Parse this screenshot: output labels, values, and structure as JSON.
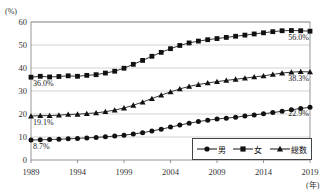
{
  "chart_data": {
    "type": "line",
    "title": "",
    "xlabel": "(年)",
    "ylabel": "(%)",
    "ylim": [
      0,
      60
    ],
    "yticks": [
      0,
      10,
      20,
      30,
      40,
      50,
      60
    ],
    "xticks": [
      "1989",
      "1994",
      "1999",
      "2004",
      "2009",
      "2014",
      "2019"
    ],
    "grid": true,
    "legend_position": "bottom-right",
    "x": [
      1989,
      1990,
      1991,
      1992,
      1993,
      1994,
      1995,
      1996,
      1997,
      1998,
      1999,
      2000,
      2001,
      2002,
      2003,
      2004,
      2005,
      2006,
      2007,
      2008,
      2009,
      2010,
      2011,
      2012,
      2013,
      2014,
      2015,
      2016,
      2017,
      2018,
      2019
    ],
    "series": [
      {
        "name": "男",
        "marker": "circle",
        "values": [
          8.7,
          8.8,
          8.9,
          9.0,
          9.2,
          9.4,
          9.6,
          9.8,
          10.1,
          10.4,
          10.8,
          11.3,
          11.9,
          12.6,
          13.4,
          14.3,
          15.2,
          16.0,
          16.7,
          17.3,
          17.8,
          18.2,
          18.6,
          19.1,
          19.6,
          20.1,
          20.6,
          21.2,
          21.8,
          22.4,
          22.9
        ],
        "label_start": "8.7%",
        "label_end": "22.9%"
      },
      {
        "name": "女",
        "marker": "square",
        "values": [
          36.0,
          36.4,
          36.1,
          36.3,
          36.6,
          36.4,
          36.8,
          37.1,
          37.8,
          38.6,
          39.9,
          41.6,
          43.3,
          45.1,
          46.8,
          48.4,
          49.8,
          50.9,
          51.7,
          52.3,
          52.8,
          53.3,
          53.8,
          54.3,
          54.8,
          55.3,
          55.8,
          56.2,
          56.3,
          56.2,
          56.0
        ],
        "label_start": "36.0%",
        "label_end": "56.0%"
      },
      {
        "name": "総数",
        "marker": "triangle",
        "values": [
          19.1,
          19.3,
          19.3,
          19.5,
          19.8,
          19.9,
          20.2,
          20.5,
          21.0,
          21.7,
          22.6,
          23.8,
          25.2,
          26.7,
          28.2,
          29.6,
          30.9,
          32.0,
          32.8,
          33.5,
          34.1,
          34.6,
          35.1,
          35.6,
          36.1,
          36.6,
          37.2,
          37.8,
          38.2,
          38.4,
          38.3
        ],
        "label_start": "19.1%",
        "label_end": "38.3%"
      }
    ]
  },
  "axis": {
    "y_unit": "(%)",
    "x_unit": "(年)"
  },
  "legend": {
    "items": [
      {
        "label": "男",
        "marker": "circle"
      },
      {
        "label": "女",
        "marker": "square"
      },
      {
        "label": "総数",
        "marker": "triangle"
      }
    ]
  },
  "annotations": {
    "left": [
      {
        "text": "36.0%",
        "series": "女"
      },
      {
        "text": "19.1%",
        "series": "総数"
      },
      {
        "text": "8.7%",
        "series": "男"
      }
    ],
    "right": [
      {
        "text": "56.0%",
        "series": "女"
      },
      {
        "text": "38.3%",
        "series": "総数"
      },
      {
        "text": "22.9%",
        "series": "男"
      }
    ]
  },
  "colors": {
    "line": "#111111",
    "grid": "#c8c8c8",
    "axis": "#8a8a8a",
    "text": "#222222"
  }
}
